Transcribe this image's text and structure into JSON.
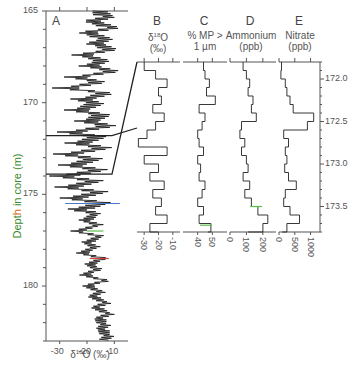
{
  "chart_data": [
    {
      "type": "line",
      "panel": "A",
      "title": "",
      "xlabel": "δ18O (‰)",
      "ylabel": "Depth in core (m)",
      "xlim": [
        -35,
        -5
      ],
      "ylim": [
        183,
        165
      ],
      "x_ticks": [
        -30,
        -20,
        -10
      ],
      "y_ticks": [
        165,
        170,
        175,
        180
      ],
      "grid": false,
      "orientation": "vertical-profile",
      "series": [
        {
          "name": "δ18O",
          "depth": [
            165.0,
            165.3,
            165.6,
            165.9,
            166.2,
            166.5,
            166.8,
            167.1,
            167.4,
            167.7,
            168.0,
            168.3,
            168.6,
            168.9,
            169.2,
            169.5,
            169.8,
            170.1,
            170.4,
            170.7,
            171.0,
            171.3,
            171.6,
            171.9,
            172.2,
            172.5,
            172.8,
            173.1,
            173.4,
            173.7,
            174.0,
            174.3,
            174.6,
            174.9,
            175.2,
            175.5,
            175.8,
            176.1,
            176.4,
            176.7,
            177.0,
            177.3,
            177.6,
            177.9,
            178.2,
            178.5,
            178.8,
            179.1,
            179.4,
            179.7,
            180.0,
            180.3,
            180.6,
            180.9,
            181.2,
            181.5,
            181.8,
            182.1,
            182.4,
            182.7,
            183.0
          ],
          "values": [
            -18,
            -14,
            -20,
            -12,
            -22,
            -15,
            -19,
            -13,
            -24,
            -16,
            -21,
            -12,
            -26,
            -17,
            -30,
            -14,
            -23,
            -18,
            -25,
            -15,
            -21,
            -13,
            -27,
            -16,
            -24,
            -14,
            -28,
            -17,
            -26,
            -15,
            -29,
            -16,
            -27,
            -14,
            -25,
            -13,
            -22,
            -16,
            -20,
            -15,
            -23,
            -14,
            -19,
            -16,
            -21,
            -13,
            -18,
            -15,
            -20,
            -12,
            -19,
            -14,
            -17,
            -12,
            -16,
            -11,
            -15,
            -13,
            -14,
            -12,
            -13
          ]
        }
      ],
      "annotations": [
        "zoom lines from 171.8 m and 173.9 m to panels B–E"
      ]
    },
    {
      "type": "line",
      "panel": "B",
      "title": "δ18O (‰)",
      "xlim": [
        -35,
        -5
      ],
      "x_ticks": [
        -30,
        -20,
        -10
      ],
      "ylim": [
        173.8,
        171.8
      ],
      "series": [
        {
          "name": "δ18O",
          "depth": [
            171.8,
            171.9,
            172.0,
            172.1,
            172.2,
            172.3,
            172.4,
            172.5,
            172.6,
            172.7,
            172.8,
            172.9,
            173.0,
            173.1,
            173.2,
            173.3,
            173.4,
            173.5,
            173.6,
            173.7,
            173.8
          ],
          "values": [
            -30,
            -22,
            -14,
            -20,
            -18,
            -24,
            -16,
            -22,
            -28,
            -34,
            -14,
            -30,
            -20,
            -26,
            -16,
            -24,
            -18,
            -22,
            -14,
            -26,
            -20
          ]
        }
      ]
    },
    {
      "type": "line",
      "panel": "C",
      "title": "% MP > 1 µm",
      "xlim": [
        30,
        60
      ],
      "x_ticks": [
        40,
        50
      ],
      "ylim": [
        173.8,
        171.8
      ],
      "series": [
        {
          "name": "% MP > 1 µm",
          "depth": [
            171.8,
            171.9,
            172.0,
            172.1,
            172.2,
            172.3,
            172.4,
            172.5,
            172.6,
            172.7,
            172.8,
            172.9,
            173.0,
            173.1,
            173.2,
            173.3,
            173.4,
            173.5,
            173.6,
            173.7,
            173.8
          ],
          "values": [
            44,
            45,
            48,
            46,
            52,
            41,
            45,
            43,
            40,
            41,
            44,
            40,
            42,
            41,
            45,
            43,
            40,
            44,
            41,
            49,
            47
          ]
        }
      ]
    },
    {
      "type": "line",
      "panel": "D",
      "title": "Ammonium (ppb)",
      "xlim": [
        0,
        280
      ],
      "x_ticks": [
        0,
        100,
        200
      ],
      "ylim": [
        173.8,
        171.8
      ],
      "series": [
        {
          "name": "Ammonium",
          "depth": [
            171.8,
            171.9,
            172.0,
            172.1,
            172.2,
            172.3,
            172.4,
            172.5,
            172.6,
            172.7,
            172.8,
            172.9,
            173.0,
            173.1,
            173.2,
            173.3,
            173.4,
            173.5,
            173.6,
            173.7,
            173.8
          ],
          "values": [
            80,
            100,
            120,
            110,
            140,
            130,
            160,
            70,
            60,
            90,
            70,
            100,
            110,
            80,
            120,
            90,
            130,
            170,
            230,
            200,
            110
          ]
        }
      ]
    },
    {
      "type": "line",
      "panel": "E",
      "title": "Nitrate (ppb)",
      "xlim": [
        0,
        1300
      ],
      "x_ticks": [
        0,
        500,
        1000
      ],
      "ylim": [
        173.8,
        171.8
      ],
      "series": [
        {
          "name": "Nitrate",
          "depth": [
            171.8,
            171.9,
            172.0,
            172.1,
            172.2,
            172.3,
            172.4,
            172.5,
            172.6,
            172.7,
            172.8,
            172.9,
            173.0,
            173.1,
            173.2,
            173.3,
            173.4,
            173.5,
            173.6,
            173.7,
            173.8
          ],
          "values": [
            80,
            60,
            200,
            250,
            350,
            450,
            1100,
            900,
            150,
            300,
            200,
            250,
            180,
            300,
            550,
            200,
            150,
            350,
            650,
            250,
            100
          ]
        }
      ]
    },
    {
      "type": "axis",
      "panel": "shared-right-axis",
      "ylim": [
        171.8,
        173.8
      ],
      "y_ticks": [
        172.0,
        172.5,
        173.0,
        173.5
      ]
    }
  ],
  "labels": {
    "panel_a": "A",
    "panel_b": "B",
    "panel_c": "C",
    "panel_d": "D",
    "panel_e": "E",
    "ylabel_pre": "Dept",
    "ylabel_hl": "h",
    "ylabel_post": " in core (m)",
    "xlabel_a_delta": "δ",
    "xlabel_a_sup": "18",
    "xlabel_a_rest": "O (‰)",
    "title_b_delta": "δ",
    "title_b_sup": "18",
    "title_b_o": "O",
    "title_b_unit": "(‰)",
    "title_c_line1": "% MP >",
    "title_c_line2": "1 µm",
    "title_d_line1": "Ammonium",
    "title_d_line2": "(ppb)",
    "title_e_line1": "Nitrate",
    "title_e_line2": "(ppb)"
  },
  "colors": {
    "axis": "#555555",
    "trace": "#222222",
    "ylabel": "#3a8a2a",
    "ylabel_highlight": "#d86a1a",
    "accent_blue": "#4a78c8",
    "accent_green": "#5cc04a",
    "accent_red": "#d84040"
  }
}
